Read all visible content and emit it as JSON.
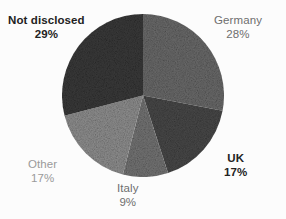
{
  "chart_data": {
    "type": "pie",
    "title": "",
    "subtitle": "",
    "xlabel": "",
    "ylabel": "",
    "legend_position": "none",
    "grid": false,
    "start_angle_deg": 0,
    "direction": "clockwise",
    "categories": [
      "Germany",
      "UK",
      "Italy",
      "Other",
      "Not disclosed"
    ],
    "values": [
      28,
      17,
      9,
      17,
      29
    ],
    "value_unit": "%",
    "slices": [
      {
        "label": "Germany",
        "value": 28,
        "value_text": "28%",
        "color": "#6b6b6b",
        "start_deg": 0.0,
        "end_deg": 100.8,
        "label_color": "#6e6e6e",
        "label_weight": "normal"
      },
      {
        "label": "UK",
        "value": 17,
        "value_text": "17%",
        "color": "#494949",
        "start_deg": 100.8,
        "end_deg": 162.0,
        "label_color": "#222222",
        "label_weight": "bold"
      },
      {
        "label": "Italy",
        "value": 9,
        "value_text": "9%",
        "color": "#757575",
        "start_deg": 162.0,
        "end_deg": 194.4,
        "label_color": "#6e6e6e",
        "label_weight": "normal"
      },
      {
        "label": "Other",
        "value": 17,
        "value_text": "17%",
        "color": "#909090",
        "start_deg": 194.4,
        "end_deg": 255.6,
        "label_color": "#9a9a9a",
        "label_weight": "normal"
      },
      {
        "label": "Not disclosed",
        "value": 29,
        "value_text": "29%",
        "color": "#3a3a3a",
        "start_deg": 255.6,
        "end_deg": 360.0,
        "label_color": "#222222",
        "label_weight": "bold"
      }
    ],
    "background_color": "#fcfcfc"
  },
  "labels": {
    "germany": {
      "name": "Germany",
      "pct": "28%"
    },
    "uk": {
      "name": "UK",
      "pct": "17%"
    },
    "italy": {
      "name": "Italy",
      "pct": "9%"
    },
    "other": {
      "name": "Other",
      "pct": "17%"
    },
    "not_disclosed": {
      "name": "Not disclosed",
      "pct": "29%"
    }
  }
}
